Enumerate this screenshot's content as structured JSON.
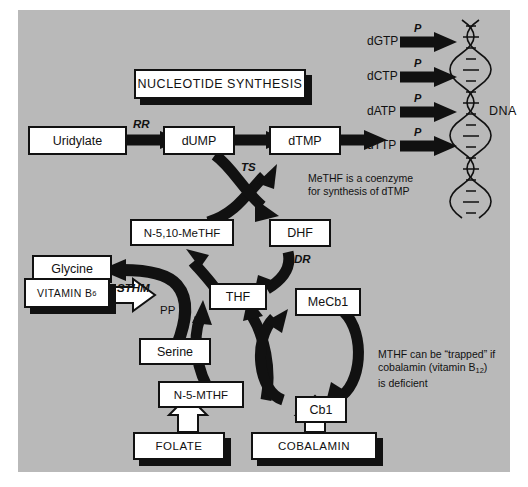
{
  "diagram": {
    "background_color": "#b9b9b9",
    "ink_color": "#111111",
    "box_fill": "#ffffff"
  },
  "banner": {
    "label": "NUCLEOTIDE SYNTHESIS"
  },
  "nodes": {
    "uridylate": "Uridylate",
    "dump": "dUMP",
    "dtmp": "dTMP",
    "n510methf": "N-5,10-MeTHF",
    "dhf": "DHF",
    "thf": "THF",
    "glycine": "Glycine",
    "vitamin_b6_pre": "VITAMIN B",
    "vitamin_b6_sub": "6",
    "serine": "Serine",
    "mecb1": "MeCb1",
    "cb1": "Cb1",
    "n5mthf": "N-5-MTHF",
    "folate": "FOLATE",
    "cobalamin": "COBALAMIN"
  },
  "enzymes": {
    "rr": "RR",
    "ts": "TS",
    "dr": "DR",
    "sthm": "STHM",
    "pp": "PP"
  },
  "dna": {
    "label": "DNA",
    "phosphate_label": "P",
    "precursors": [
      {
        "name": "dGTP"
      },
      {
        "name": "dCTP"
      },
      {
        "name": "dATP"
      },
      {
        "name": "dTTP"
      }
    ]
  },
  "captions": {
    "methf": {
      "line1": "MeTHF is a coenzyme",
      "line2": "for synthesis of dTMP"
    },
    "trapped": {
      "line1": "MTHF can be “trapped” if",
      "line2_pre": "cobalamin (vitamin B",
      "line2_sub": "12",
      "line2_post": ")",
      "line3": "is deficient"
    }
  }
}
